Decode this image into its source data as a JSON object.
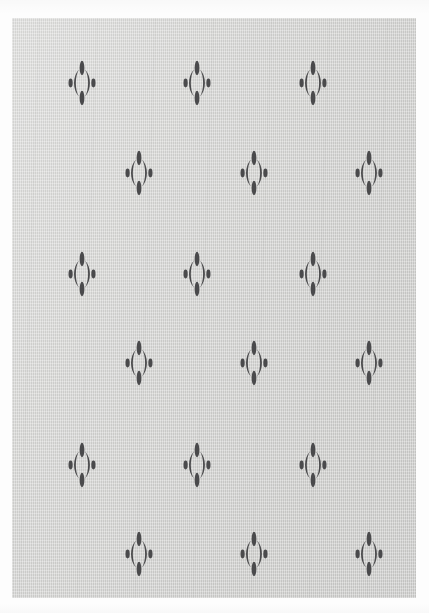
{
  "artwork": {
    "title": "Patterned Textile Rug",
    "subject": "rug",
    "surface_label": "woven fabric field",
    "border_label": "white photo border"
  },
  "colors": {
    "page_background": "#fdfdfd",
    "field_background": "#d4d4d2",
    "motif_fill": "#4a4a4c",
    "border": "#ffffff"
  },
  "field": {
    "x": 12,
    "y": 18,
    "width": 404,
    "height": 580
  },
  "motif": {
    "name": "floral-ornament-motif",
    "width": 28,
    "height": 46,
    "parts": [
      "top-petal",
      "bottom-petal",
      "left-crescent-arc",
      "right-crescent-arc",
      "left-dot",
      "right-dot"
    ]
  },
  "pattern": {
    "type": "offset-grid",
    "rows": 6,
    "columns_per_row": 3,
    "row_spacing": 88,
    "column_spacing": 115,
    "row_offset": 57,
    "motifs": [
      {
        "row": 1,
        "col": 1,
        "x": 70,
        "y": 65
      },
      {
        "row": 1,
        "col": 2,
        "x": 185,
        "y": 65
      },
      {
        "row": 1,
        "col": 3,
        "x": 301,
        "y": 65
      },
      {
        "row": 2,
        "col": 1,
        "x": 127,
        "y": 155
      },
      {
        "row": 2,
        "col": 2,
        "x": 242,
        "y": 155
      },
      {
        "row": 2,
        "col": 3,
        "x": 357,
        "y": 155
      },
      {
        "row": 3,
        "col": 1,
        "x": 70,
        "y": 256
      },
      {
        "row": 3,
        "col": 2,
        "x": 185,
        "y": 256
      },
      {
        "row": 3,
        "col": 3,
        "x": 301,
        "y": 256
      },
      {
        "row": 4,
        "col": 1,
        "x": 127,
        "y": 345
      },
      {
        "row": 4,
        "col": 2,
        "x": 242,
        "y": 345
      },
      {
        "row": 4,
        "col": 3,
        "x": 357,
        "y": 345
      },
      {
        "row": 5,
        "col": 1,
        "x": 70,
        "y": 447
      },
      {
        "row": 5,
        "col": 2,
        "x": 185,
        "y": 447
      },
      {
        "row": 5,
        "col": 3,
        "x": 301,
        "y": 447
      },
      {
        "row": 6,
        "col": 1,
        "x": 127,
        "y": 536
      },
      {
        "row": 6,
        "col": 2,
        "x": 242,
        "y": 536
      },
      {
        "row": 6,
        "col": 3,
        "x": 357,
        "y": 536
      }
    ]
  }
}
